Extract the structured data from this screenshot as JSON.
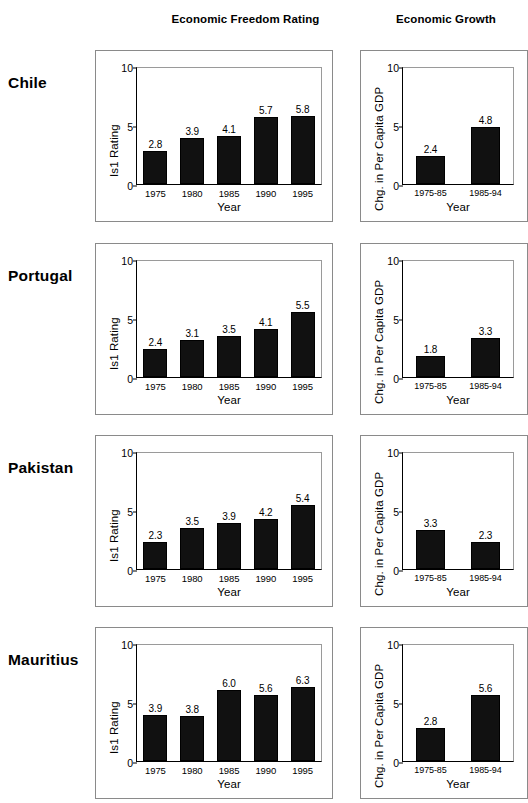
{
  "headers": {
    "left": "Economic Freedom Rating",
    "right": "Economic Growth"
  },
  "axis": {
    "left_ylabel": "Is1 Rating",
    "right_ylabel": "Chg. in Per Capita GDP",
    "xlabel": "Year",
    "yticks": [
      "0",
      "5",
      "10"
    ],
    "left_xticks": [
      "1975",
      "1980",
      "1985",
      "1990",
      "1995"
    ],
    "right_xticks": [
      "1975-85",
      "1985-94"
    ]
  },
  "countries": [
    {
      "name": "Chile"
    },
    {
      "name": "Portugal"
    },
    {
      "name": "Pakistan"
    },
    {
      "name": "Mauritius"
    }
  ],
  "chart_data": [
    {
      "type": "bar",
      "title": "Economic Freedom Rating",
      "panel": "Chile - Economic Freedom Rating",
      "country": "Chile",
      "xlabel": "Year",
      "ylabel": "Is1 Rating",
      "ylim": [
        0,
        10
      ],
      "yticks": [
        0,
        5,
        10
      ],
      "grid": false,
      "legend": false,
      "categories": [
        "1975",
        "1980",
        "1985",
        "1990",
        "1995"
      ],
      "values": [
        2.8,
        3.9,
        4.1,
        5.7,
        5.8
      ],
      "labels": [
        "2.8",
        "3.9",
        "4.1",
        "5.7",
        "5.8"
      ]
    },
    {
      "type": "bar",
      "title": "Economic Growth",
      "panel": "Chile - Economic Growth",
      "country": "Chile",
      "xlabel": "Year",
      "ylabel": "Chg. in Per Capita GDP",
      "ylim": [
        0,
        10
      ],
      "yticks": [
        0,
        5,
        10
      ],
      "grid": false,
      "legend": false,
      "categories": [
        "1975-85",
        "1985-94"
      ],
      "values": [
        2.4,
        4.8
      ],
      "labels": [
        "2.4",
        "4.8"
      ]
    },
    {
      "type": "bar",
      "title": "Economic Freedom Rating",
      "panel": "Portugal - Economic Freedom Rating",
      "country": "Portugal",
      "xlabel": "Year",
      "ylabel": "Is1 Rating",
      "ylim": [
        0,
        10
      ],
      "yticks": [
        0,
        5,
        10
      ],
      "grid": false,
      "legend": false,
      "categories": [
        "1975",
        "1980",
        "1985",
        "1990",
        "1995"
      ],
      "values": [
        2.4,
        3.1,
        3.5,
        4.1,
        5.5
      ],
      "labels": [
        "2.4",
        "3.1",
        "3.5",
        "4.1",
        "5.5"
      ]
    },
    {
      "type": "bar",
      "title": "Economic Growth",
      "panel": "Portugal - Economic Growth",
      "country": "Portugal",
      "xlabel": "Year",
      "ylabel": "Chg. in Per Capita GDP",
      "ylim": [
        0,
        10
      ],
      "yticks": [
        0,
        5,
        10
      ],
      "grid": false,
      "legend": false,
      "categories": [
        "1975-85",
        "1985-94"
      ],
      "values": [
        1.8,
        3.3
      ],
      "labels": [
        "1.8",
        "3.3"
      ]
    },
    {
      "type": "bar",
      "title": "Economic Freedom Rating",
      "panel": "Pakistan - Economic Freedom Rating",
      "country": "Pakistan",
      "xlabel": "Year",
      "ylabel": "Is1 Rating",
      "ylim": [
        0,
        10
      ],
      "yticks": [
        0,
        5,
        10
      ],
      "grid": false,
      "legend": false,
      "categories": [
        "1975",
        "1980",
        "1985",
        "1990",
        "1995"
      ],
      "values": [
        2.3,
        3.5,
        3.9,
        4.2,
        5.4
      ],
      "labels": [
        "2.3",
        "3.5",
        "3.9",
        "4.2",
        "5.4"
      ]
    },
    {
      "type": "bar",
      "title": "Economic Growth",
      "panel": "Pakistan - Economic Growth",
      "country": "Pakistan",
      "xlabel": "Year",
      "ylabel": "Chg. in Per Capita GDP",
      "ylim": [
        0,
        10
      ],
      "yticks": [
        0,
        5,
        10
      ],
      "grid": false,
      "legend": false,
      "categories": [
        "1975-85",
        "1985-94"
      ],
      "values": [
        3.3,
        2.3
      ],
      "labels": [
        "3.3",
        "2.3"
      ]
    },
    {
      "type": "bar",
      "title": "Economic Freedom Rating",
      "panel": "Mauritius - Economic Freedom Rating",
      "country": "Mauritius",
      "xlabel": "Year",
      "ylabel": "Is1 Rating",
      "ylim": [
        0,
        10
      ],
      "yticks": [
        0,
        5,
        10
      ],
      "grid": false,
      "legend": false,
      "categories": [
        "1975",
        "1980",
        "1985",
        "1990",
        "1995"
      ],
      "values": [
        3.9,
        3.8,
        6.0,
        5.6,
        6.3
      ],
      "labels": [
        "3.9",
        "3.8",
        "6.0",
        "5.6",
        "6.3"
      ]
    },
    {
      "type": "bar",
      "title": "Economic Growth",
      "panel": "Mauritius - Economic Growth",
      "country": "Mauritius",
      "xlabel": "Year",
      "ylabel": "Chg. in Per Capita GDP",
      "ylim": [
        0,
        10
      ],
      "yticks": [
        0,
        5,
        10
      ],
      "grid": false,
      "legend": false,
      "categories": [
        "1975-85",
        "1985-94"
      ],
      "values": [
        2.8,
        5.6
      ],
      "labels": [
        "2.8",
        "5.6"
      ]
    }
  ],
  "layout": {
    "row_tops": [
      50,
      243,
      435,
      627
    ],
    "label_tops": [
      74,
      267,
      459,
      651
    ],
    "colors": {
      "bar": "#111111",
      "frame": "#8a8a8a",
      "axis": "#000000"
    }
  }
}
